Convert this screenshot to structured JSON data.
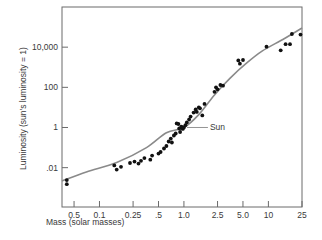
{
  "chart_data": {
    "type": "scatter",
    "title": "",
    "xlabel": "Mass (solar masses)",
    "ylabel": "Luminosity (sun's luminosity = 1)",
    "x_scale": "log",
    "y_scale": "log",
    "xlim": [
      0.036,
      25
    ],
    "ylim": [
      0.00011,
      1000000
    ],
    "grid": false,
    "legend": "none",
    "x_ticks": [
      {
        "label": "0.5",
        "value": 0.05
      },
      {
        "label": "0.1",
        "value": 0.1
      },
      {
        "label": "0.25",
        "value": 0.25
      },
      {
        "label": ".5",
        "value": 0.5
      },
      {
        "label": "1.0",
        "value": 1.0
      },
      {
        "label": "2.5",
        "value": 2.5
      },
      {
        "label": "5.0",
        "value": 5.0
      },
      {
        "label": "10",
        "value": 10
      },
      {
        "label": "25",
        "value": 25
      }
    ],
    "y_ticks": [
      {
        "label": "10,000",
        "value": 10000
      },
      {
        "label": "100",
        "value": 100
      },
      {
        "label": "1",
        "value": 1
      },
      {
        "label": ".01",
        "value": 0.01
      }
    ],
    "series": [
      {
        "name": "Main-sequence stars",
        "kind": "points",
        "points": [
          [
            0.041,
            0.0024
          ],
          [
            0.041,
            0.0015
          ],
          [
            0.15,
            0.013
          ],
          [
            0.16,
            0.008
          ],
          [
            0.18,
            0.011
          ],
          [
            0.23,
            0.017
          ],
          [
            0.26,
            0.02
          ],
          [
            0.29,
            0.016
          ],
          [
            0.31,
            0.022
          ],
          [
            0.34,
            0.03
          ],
          [
            0.4,
            0.025
          ],
          [
            0.42,
            0.04
          ],
          [
            0.5,
            0.05
          ],
          [
            0.53,
            0.06
          ],
          [
            0.58,
            0.09
          ],
          [
            0.62,
            0.12
          ],
          [
            0.66,
            0.2
          ],
          [
            0.7,
            0.28
          ],
          [
            0.72,
            0.18
          ],
          [
            0.76,
            0.4
          ],
          [
            0.8,
            0.5
          ],
          [
            0.82,
            1.6
          ],
          [
            0.86,
            1.5
          ],
          [
            0.88,
            0.9
          ],
          [
            0.9,
            0.6
          ],
          [
            0.93,
            1.1
          ],
          [
            0.95,
            1.0
          ],
          [
            0.97,
            0.85
          ],
          [
            1.0,
            1.0
          ],
          [
            1.04,
            1.3
          ],
          [
            1.08,
            1.8
          ],
          [
            1.15,
            2.5
          ],
          [
            1.2,
            3.5
          ],
          [
            1.3,
            5.5
          ],
          [
            1.38,
            8
          ],
          [
            1.42,
            6
          ],
          [
            1.5,
            10
          ],
          [
            1.55,
            9
          ],
          [
            1.65,
            4
          ],
          [
            1.75,
            15
          ],
          [
            2.3,
            60
          ],
          [
            2.4,
            100
          ],
          [
            2.5,
            80
          ],
          [
            2.7,
            130
          ],
          [
            2.9,
            120
          ],
          [
            4.4,
            2200
          ],
          [
            4.6,
            1500
          ],
          [
            5.0,
            2300
          ],
          [
            9.5,
            10500
          ],
          [
            14,
            7000
          ],
          [
            16,
            14000
          ],
          [
            18,
            14000
          ],
          [
            19,
            45000
          ],
          [
            24,
            42000
          ]
        ]
      },
      {
        "name": "Mass-luminosity relation",
        "kind": "curve",
        "points": [
          [
            0.036,
            0.0022
          ],
          [
            0.07,
            0.0061
          ],
          [
            0.16,
            0.018
          ],
          [
            0.36,
            0.1
          ],
          [
            0.62,
            0.55
          ],
          [
            1.0,
            1.0
          ],
          [
            1.5,
            4.4
          ],
          [
            2.3,
            42
          ],
          [
            3.5,
            280
          ],
          [
            5.5,
            1600
          ],
          [
            8.5,
            6500
          ],
          [
            15,
            25000
          ],
          [
            25,
            90000
          ]
        ]
      }
    ],
    "annotations": [
      {
        "text": "Sun",
        "x": 1.0,
        "y": 1.0
      }
    ]
  }
}
